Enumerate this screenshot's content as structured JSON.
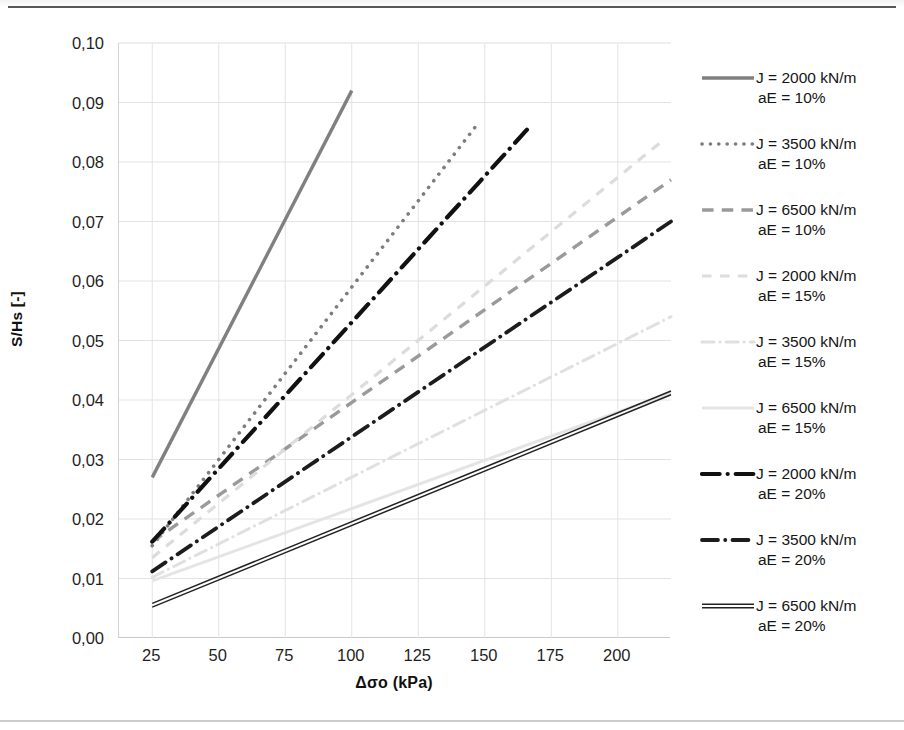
{
  "chart_data": {
    "type": "line",
    "title": "",
    "xlabel": "Δσo (kPa)",
    "ylabel": "S/Hs [-]",
    "xlim": [
      12.5,
      220
    ],
    "ylim": [
      0.0,
      0.1
    ],
    "grid": true,
    "legend_position": "right",
    "xticks": [
      25,
      50,
      75,
      100,
      125,
      150,
      175,
      200
    ],
    "xticklabels": [
      "25",
      "50",
      "75",
      "100",
      "125",
      "150",
      "175",
      "200"
    ],
    "yticks": [
      0.0,
      0.01,
      0.02,
      0.03,
      0.04,
      0.05,
      0.06,
      0.07,
      0.08,
      0.09,
      0.1
    ],
    "yticklabels": [
      "0,00",
      "0,01",
      "0,02",
      "0,03",
      "0,04",
      "0,05",
      "0,06",
      "0,07",
      "0,08",
      "0,09",
      "0,10"
    ],
    "series": [
      {
        "name": "J = 2000 kN/m aE = 10%",
        "style": "solid",
        "color": "#808080",
        "width": 3.4,
        "x": [
          25,
          100
        ],
        "y": [
          0.027,
          0.092
        ]
      },
      {
        "name": "J = 3500 kN/m aE = 10%",
        "style": "dotted",
        "color": "#7d7d7d",
        "width": 3.6,
        "x": [
          25,
          148
        ],
        "y": [
          0.0155,
          0.0868
        ]
      },
      {
        "name": "J = 6500 kN/m aE = 10%",
        "style": "dashed",
        "color": "#9a9a9a",
        "width": 3.4,
        "x": [
          25,
          220
        ],
        "y": [
          0.0162,
          0.077
        ]
      },
      {
        "name": "J = 2000 kN/m aE = 15%",
        "style": "dashed-light",
        "color": "#dcdcdc",
        "width": 3.2,
        "x": [
          25,
          218
        ],
        "y": [
          0.0135,
          0.084
        ]
      },
      {
        "name": "J = 3500 kN/m aE = 15%",
        "style": "dash-dot-light",
        "color": "#e0e0e0",
        "width": 3.0,
        "x": [
          25,
          220
        ],
        "y": [
          0.0102,
          0.054
        ]
      },
      {
        "name": "J = 6500 kN/m aE = 15%",
        "style": "solid-light",
        "color": "#e4e4e4",
        "width": 3.0,
        "x": [
          25,
          220
        ],
        "y": [
          0.0096,
          0.0412
        ]
      },
      {
        "name": "J = 2000 kN/m aE = 20%",
        "style": "dash-dot",
        "color": "#111111",
        "width": 4.2,
        "x": [
          25,
          166
        ],
        "y": [
          0.0162,
          0.0855
        ]
      },
      {
        "name": "J = 3500 kN/m aE = 20%",
        "style": "dash-dot",
        "color": "#1c1c1c",
        "width": 3.8,
        "x": [
          25,
          220
        ],
        "y": [
          0.0112,
          0.07
        ]
      },
      {
        "name": "J = 6500 kN/m aE = 20%",
        "style": "solid-double",
        "color": "#222222",
        "width": 3.2,
        "x": [
          25,
          220
        ],
        "y": [
          0.0055,
          0.0412
        ]
      }
    ]
  },
  "axes": {
    "x_title": "Δσo (kPa)",
    "y_title": "S/Hs [-]",
    "x_ticks": [
      "25",
      "50",
      "75",
      "100",
      "125",
      "150",
      "175",
      "200"
    ],
    "y_ticks": [
      "0,10",
      "0,09",
      "0,08",
      "0,07",
      "0,06",
      "0,05",
      "0,04",
      "0,03",
      "0,02",
      "0,01",
      "0,00"
    ]
  },
  "legend": {
    "items": [
      {
        "line1": "J = 2000 kN/m",
        "line2": "aE = 10%",
        "swatch": "solid-gray-line-icon"
      },
      {
        "line1": "J = 3500 kN/m",
        "line2": "aE = 10%",
        "swatch": "dotted-gray-line-icon"
      },
      {
        "line1": "J = 6500 kN/m",
        "line2": "aE = 10%",
        "swatch": "dashed-gray-line-icon"
      },
      {
        "line1": "J = 2000 kN/m",
        "line2": "aE = 15%",
        "swatch": "dashed-light-line-icon"
      },
      {
        "line1": "J = 3500 kN/m",
        "line2": "aE = 15%",
        "swatch": "dash-dot-light-line-icon"
      },
      {
        "line1": "J = 6500 kN/m",
        "line2": "aE = 15%",
        "swatch": "solid-light-line-icon"
      },
      {
        "line1": "J = 2000 kN/m",
        "line2": "aE = 20%",
        "swatch": "dash-dot-black-line-icon"
      },
      {
        "line1": "J = 3500 kN/m",
        "line2": "aE = 20%",
        "swatch": "dash-dot-dark-line-icon"
      },
      {
        "line1": "J = 6500 kN/m",
        "line2": "aE = 20%",
        "swatch": "solid-black-line-icon"
      }
    ]
  },
  "colors": {
    "grid": "#e3e3e3",
    "axis": "#cfcfcf",
    "text": "#1a1a1a",
    "light_series": "#e0e0e0",
    "mid_series": "#8a8a8a",
    "dark_series": "#161616"
  }
}
